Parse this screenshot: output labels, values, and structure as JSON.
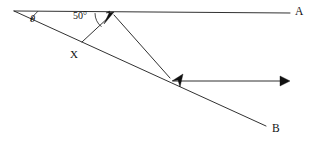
{
  "figure": {
    "type": "geometry-diagram",
    "background_color": "#ffffff",
    "stroke_color": "#1a1a1a",
    "labels": {
      "ray_a_endpoint": "A",
      "ray_b_endpoint": "B",
      "intersection_point": "X",
      "angle_theta": "θ",
      "angle_fifty": "50°"
    },
    "angles": [
      {
        "name": "theta",
        "label": "θ",
        "value": null,
        "unit": "degrees",
        "vertex": "left-apex"
      },
      {
        "name": "fifty",
        "label": "50°",
        "value": 50,
        "unit": "degrees",
        "vertex": "top-arrow-point"
      }
    ],
    "points": {
      "apex": {
        "x": 14,
        "y": 11
      },
      "a_end": {
        "x": 290,
        "y": 13
      },
      "top_vertex": {
        "x": 113,
        "y": 13
      },
      "x_point": {
        "x": 82,
        "y": 42
      },
      "mid_vertex": {
        "x": 173,
        "y": 81
      },
      "b_end": {
        "x": 266,
        "y": 126
      },
      "ray_right_end": {
        "x": 289,
        "y": 81
      }
    },
    "arrowheads": [
      {
        "name": "top-arrowhead",
        "at": {
          "x": 113,
          "y": 13
        },
        "direction": "up-right"
      },
      {
        "name": "mid-arrowhead",
        "at": {
          "x": 173,
          "y": 81
        },
        "direction": "down-left"
      },
      {
        "name": "right-arrowhead",
        "at": {
          "x": 289,
          "y": 81
        },
        "direction": "right"
      }
    ]
  }
}
